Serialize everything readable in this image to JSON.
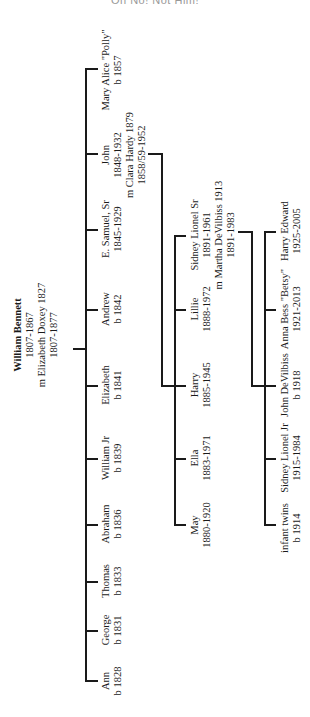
{
  "header": {
    "text": "Oh No! Not Him!"
  },
  "root": {
    "name": "William Bennett",
    "dates": "1807-1867",
    "marriage": "m Elizabeth Doxey 1827",
    "spouse_dates": "1807-1877"
  },
  "generation1": [
    {
      "name": "Mary Alice \"Polly\"",
      "dates": "b 1857"
    },
    {
      "name": "John",
      "dates": "1848-1932",
      "marriage": "m Clara Hardy 1879",
      "spouse_dates": "1858/59-1952"
    },
    {
      "name": "E. Samuel, Sr",
      "dates": "1845-1929"
    },
    {
      "name": "Andrew",
      "dates": "b 1842"
    },
    {
      "name": "Elizabeth",
      "dates": "b 1841"
    },
    {
      "name": "William Jr",
      "dates": "b 1839"
    },
    {
      "name": "Abraham",
      "dates": "b 1836"
    },
    {
      "name": "Thomas",
      "dates": "b 1833"
    },
    {
      "name": "George",
      "dates": "b 1831"
    },
    {
      "name": "Ann",
      "dates": "b 1828"
    }
  ],
  "generation2": [
    {
      "name": "Sidney Lionel Sr",
      "dates": "1891-1961",
      "marriage": "m Martha DeVilbiss 1913",
      "spouse_dates": "1891-1983"
    },
    {
      "name": "Lillie",
      "dates": "1888-1972"
    },
    {
      "name": "Harry",
      "dates": "1885-1945"
    },
    {
      "name": "Ella",
      "dates": "1883-1971"
    },
    {
      "name": "May",
      "dates": "1880-1920"
    }
  ],
  "generation3": [
    {
      "name": "Harry Edward",
      "dates": "1925-2005"
    },
    {
      "name": "Anna Bess \"Betsy\"",
      "dates": "1921-2013"
    },
    {
      "name": "John DeVilbiss",
      "dates": "b 1918"
    },
    {
      "name": "Sidney Lionel Jr",
      "dates": "1915-1984"
    },
    {
      "name": "infant twins",
      "dates": "b 1914"
    }
  ]
}
